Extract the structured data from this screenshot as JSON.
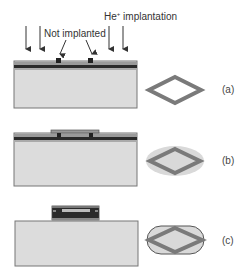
{
  "labels": {
    "he_implantation": "He",
    "he_superscript": "+",
    "he_suffix": " implantation",
    "not_implanted": "Not implanted"
  },
  "panels": [
    {
      "id": "a",
      "label": "(a)"
    },
    {
      "id": "b",
      "label": "(b)"
    },
    {
      "id": "c",
      "label": "(c)"
    }
  ],
  "colors": {
    "substrate": "#dcdcdc",
    "substrate_border": "#777777",
    "dark_layer": "#2a2a2a",
    "mid_layer": "#9a9a9a",
    "diamond": "#7a7a7a",
    "halo": "#d9d9d9"
  }
}
